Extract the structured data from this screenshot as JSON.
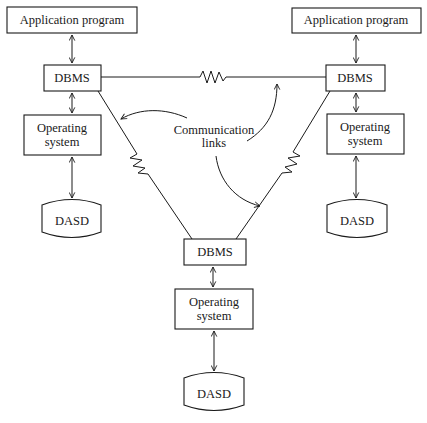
{
  "diagram": {
    "type": "distributed-database-architecture",
    "nodes": {
      "left": {
        "app_label": "Application program",
        "dbms_label": "DBMS",
        "os_label_line1": "Operating",
        "os_label_line2": "system",
        "storage_label": "DASD"
      },
      "right": {
        "app_label": "Application program",
        "dbms_label": "DBMS",
        "os_label_line1": "Operating",
        "os_label_line2": "system",
        "storage_label": "DASD"
      },
      "bottom": {
        "dbms_label": "DBMS",
        "os_label_line1": "Operating",
        "os_label_line2": "system",
        "storage_label": "DASD"
      }
    },
    "annotation": {
      "line1": "Communication",
      "line2": "links"
    },
    "links": [
      {
        "from": "left.DBMS",
        "to": "right.DBMS",
        "kind": "communication-link"
      },
      {
        "from": "left.DBMS",
        "to": "bottom.DBMS",
        "kind": "communication-link"
      },
      {
        "from": "right.DBMS",
        "to": "bottom.DBMS",
        "kind": "communication-link"
      }
    ],
    "colors": {
      "stroke": "#1a1a1a",
      "background": "#ffffff"
    }
  }
}
